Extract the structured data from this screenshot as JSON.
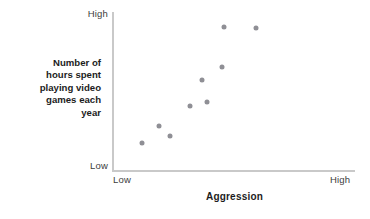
{
  "chart_data": {
    "type": "scatter",
    "title": "",
    "xlabel": "Aggression",
    "ylabel": "Number of\nhours spent\nplaying video\ngames each\nyear",
    "x_tick_labels": [
      "Low",
      "High"
    ],
    "y_tick_labels": [
      "Low",
      "High"
    ],
    "xlim": [
      0,
      100
    ],
    "ylim": [
      0,
      100
    ],
    "grid": false,
    "legend": null,
    "point_color": "#8f8f95",
    "axis_color": "#c9c9c9",
    "points": [
      {
        "x": 12.3,
        "y": 17.6
      },
      {
        "x": 19.3,
        "y": 28.3
      },
      {
        "x": 23.9,
        "y": 22.0
      },
      {
        "x": 32.1,
        "y": 40.9
      },
      {
        "x": 37.0,
        "y": 57.2
      },
      {
        "x": 39.1,
        "y": 43.4
      },
      {
        "x": 45.3,
        "y": 65.4
      },
      {
        "x": 46.1,
        "y": 90.6
      },
      {
        "x": 59.3,
        "y": 89.9
      }
    ]
  },
  "axis": {
    "y_high_label": "High",
    "y_low_label": "Low",
    "x_low_label": "Low",
    "x_high_label": "High",
    "y_title_lines": [
      "Number of",
      "hours spent",
      "playing video",
      "games each",
      "year"
    ],
    "x_title": "Aggression"
  }
}
